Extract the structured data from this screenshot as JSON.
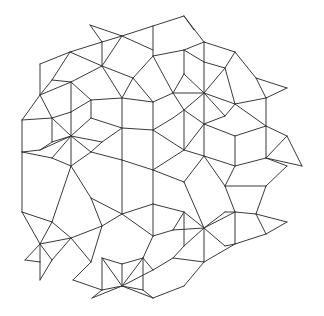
{
  "figure": {
    "stroke_color": "#3a3a3a",
    "background": "#ffffff",
    "width": 324,
    "height": 316,
    "segments": [
      [
        90,
        25,
        102,
        42
      ],
      [
        90,
        25,
        122,
        36
      ],
      [
        102,
        42,
        122,
        36
      ],
      [
        102,
        42,
        70,
        52
      ],
      [
        122,
        36,
        153,
        26
      ],
      [
        153,
        26,
        184,
        16
      ],
      [
        184,
        16,
        204,
        42
      ],
      [
        184,
        16,
        194,
        30
      ],
      [
        122,
        36,
        153,
        50
      ],
      [
        153,
        26,
        153,
        56
      ],
      [
        122,
        36,
        102,
        66
      ],
      [
        102,
        42,
        102,
        66
      ],
      [
        70,
        52,
        102,
        66
      ],
      [
        70,
        52,
        52,
        80
      ],
      [
        70,
        52,
        40,
        64
      ],
      [
        40,
        64,
        40,
        95
      ],
      [
        40,
        95,
        52,
        80
      ],
      [
        52,
        80,
        71,
        82
      ],
      [
        71,
        82,
        102,
        66
      ],
      [
        71,
        82,
        40,
        95
      ],
      [
        102,
        66,
        133,
        78
      ],
      [
        153,
        56,
        133,
        78
      ],
      [
        153,
        56,
        184,
        50
      ],
      [
        184,
        50,
        204,
        42
      ],
      [
        204,
        42,
        235,
        52
      ],
      [
        204,
        42,
        204,
        62
      ],
      [
        184,
        50,
        204,
        62
      ],
      [
        204,
        62,
        225,
        68
      ],
      [
        235,
        52,
        225,
        68
      ],
      [
        235,
        52,
        256,
        78
      ],
      [
        256,
        78,
        287,
        88
      ],
      [
        256,
        78,
        266,
        98
      ],
      [
        287,
        88,
        266,
        98
      ],
      [
        266,
        98,
        266,
        126
      ],
      [
        266,
        98,
        235,
        104
      ],
      [
        225,
        68,
        235,
        104
      ],
      [
        204,
        93,
        225,
        68
      ],
      [
        204,
        93,
        204,
        62
      ],
      [
        204,
        93,
        184,
        74
      ],
      [
        184,
        74,
        184,
        50
      ],
      [
        204,
        93,
        184,
        110
      ],
      [
        204,
        93,
        225,
        116
      ],
      [
        204,
        93,
        235,
        104
      ],
      [
        204,
        93,
        173,
        93
      ],
      [
        173,
        93,
        184,
        74
      ],
      [
        173,
        93,
        153,
        56
      ],
      [
        173,
        93,
        184,
        110
      ],
      [
        184,
        110,
        204,
        124
      ],
      [
        225,
        116,
        204,
        124
      ],
      [
        225,
        116,
        235,
        104
      ],
      [
        204,
        93,
        204,
        124
      ],
      [
        133,
        78,
        153,
        102
      ],
      [
        153,
        102,
        173,
        93
      ],
      [
        153,
        102,
        153,
        130
      ],
      [
        133,
        78,
        122,
        98
      ],
      [
        122,
        98,
        102,
        66
      ],
      [
        122,
        98,
        122,
        128
      ],
      [
        122,
        98,
        153,
        102
      ],
      [
        71,
        82,
        71,
        112
      ],
      [
        71,
        82,
        91,
        100
      ],
      [
        91,
        100,
        122,
        98
      ],
      [
        91,
        100,
        71,
        112
      ],
      [
        71,
        112,
        52,
        118
      ],
      [
        52,
        118,
        40,
        95
      ],
      [
        52,
        118,
        22,
        120
      ],
      [
        22,
        120,
        40,
        95
      ],
      [
        22,
        120,
        22,
        152
      ],
      [
        22,
        152,
        52,
        158
      ],
      [
        52,
        118,
        52,
        142
      ],
      [
        71,
        136,
        52,
        118
      ],
      [
        71,
        136,
        71,
        112
      ],
      [
        71,
        136,
        91,
        118
      ],
      [
        91,
        118,
        91,
        100
      ],
      [
        91,
        118,
        122,
        128
      ],
      [
        71,
        136,
        102,
        142
      ],
      [
        102,
        142,
        122,
        128
      ],
      [
        71,
        136,
        91,
        152
      ],
      [
        91,
        152,
        102,
        142
      ],
      [
        71,
        136,
        52,
        142
      ],
      [
        52,
        142,
        40,
        150
      ],
      [
        40,
        150,
        22,
        152
      ],
      [
        71,
        136,
        40,
        150
      ],
      [
        71,
        136,
        71,
        166
      ],
      [
        71,
        136,
        52,
        158
      ],
      [
        52,
        158,
        71,
        166
      ],
      [
        91,
        152,
        71,
        166
      ],
      [
        91,
        152,
        122,
        160
      ],
      [
        122,
        128,
        153,
        130
      ],
      [
        153,
        130,
        173,
        118
      ],
      [
        173,
        118,
        184,
        110
      ],
      [
        153,
        130,
        184,
        150
      ],
      [
        184,
        110,
        184,
        150
      ],
      [
        184,
        150,
        204,
        124
      ],
      [
        122,
        128,
        122,
        160
      ],
      [
        122,
        160,
        153,
        170
      ],
      [
        153,
        130,
        153,
        170
      ],
      [
        153,
        170,
        184,
        150
      ],
      [
        204,
        124,
        235,
        136
      ],
      [
        235,
        104,
        266,
        126
      ],
      [
        266,
        126,
        235,
        136
      ],
      [
        266,
        126,
        287,
        136
      ],
      [
        287,
        136,
        266,
        158
      ],
      [
        266,
        126,
        266,
        158
      ],
      [
        266,
        158,
        287,
        166
      ],
      [
        287,
        136,
        302,
        166
      ],
      [
        302,
        166,
        266,
        158
      ],
      [
        287,
        166,
        266,
        186
      ],
      [
        235,
        136,
        235,
        166
      ],
      [
        235,
        166,
        266,
        158
      ],
      [
        204,
        124,
        204,
        156
      ],
      [
        204,
        156,
        235,
        166
      ],
      [
        204,
        156,
        184,
        150
      ],
      [
        204,
        156,
        184,
        182
      ],
      [
        184,
        182,
        153,
        170
      ],
      [
        235,
        166,
        225,
        186
      ],
      [
        225,
        186,
        204,
        156
      ],
      [
        225,
        186,
        266,
        186
      ],
      [
        266,
        186,
        256,
        214
      ],
      [
        225,
        186,
        235,
        212
      ],
      [
        235,
        212,
        256,
        214
      ],
      [
        256,
        214,
        287,
        222
      ],
      [
        287,
        222,
        266,
        234
      ],
      [
        266,
        234,
        256,
        214
      ],
      [
        266,
        234,
        235,
        244
      ],
      [
        235,
        212,
        235,
        244
      ],
      [
        235,
        212,
        204,
        228
      ],
      [
        204,
        228,
        184,
        182
      ],
      [
        204,
        228,
        184,
        212
      ],
      [
        184,
        212,
        153,
        204
      ],
      [
        153,
        204,
        153,
        170
      ],
      [
        204,
        228,
        225,
        246
      ],
      [
        225,
        246,
        235,
        244
      ],
      [
        204,
        228,
        204,
        262
      ],
      [
        204,
        228,
        184,
        246
      ],
      [
        184,
        246,
        184,
        212
      ],
      [
        204,
        228,
        225,
        212
      ],
      [
        225,
        212,
        235,
        212
      ],
      [
        204,
        228,
        173,
        230
      ],
      [
        173,
        230,
        184,
        212
      ],
      [
        184,
        246,
        173,
        258
      ],
      [
        173,
        258,
        204,
        262
      ],
      [
        204,
        262,
        235,
        244
      ],
      [
        204,
        262,
        184,
        286
      ],
      [
        184,
        286,
        153,
        298
      ],
      [
        173,
        258,
        153,
        270
      ],
      [
        153,
        270,
        122,
        286
      ],
      [
        153,
        204,
        122,
        214
      ],
      [
        122,
        214,
        122,
        160
      ],
      [
        122,
        214,
        91,
        198
      ],
      [
        91,
        198,
        71,
        166
      ],
      [
        91,
        198,
        102,
        226
      ],
      [
        102,
        226,
        122,
        214
      ],
      [
        102,
        226,
        71,
        238
      ],
      [
        71,
        238,
        52,
        222
      ],
      [
        52,
        222,
        71,
        166
      ],
      [
        52,
        222,
        22,
        212
      ],
      [
        22,
        212,
        22,
        152
      ],
      [
        22,
        212,
        40,
        244
      ],
      [
        40,
        244,
        52,
        222
      ],
      [
        40,
        244,
        25,
        260
      ],
      [
        25,
        260,
        40,
        262
      ],
      [
        40,
        244,
        40,
        262
      ],
      [
        40,
        244,
        71,
        238
      ],
      [
        40,
        244,
        52,
        260
      ],
      [
        52,
        260,
        71,
        238
      ],
      [
        40,
        262,
        40,
        280
      ],
      [
        40,
        280,
        52,
        260
      ],
      [
        71,
        238,
        91,
        262
      ],
      [
        91,
        262,
        102,
        226
      ],
      [
        91,
        262,
        73,
        280
      ],
      [
        73,
        280,
        102,
        290
      ],
      [
        102,
        290,
        122,
        286
      ],
      [
        122,
        286,
        102,
        258
      ],
      [
        102,
        258,
        102,
        290
      ],
      [
        122,
        286,
        143,
        258
      ],
      [
        143,
        258,
        143,
        290
      ],
      [
        143,
        290,
        122,
        286
      ],
      [
        102,
        258,
        122,
        264
      ],
      [
        122,
        264,
        143,
        258
      ],
      [
        122,
        264,
        122,
        286
      ],
      [
        143,
        258,
        153,
        270
      ],
      [
        143,
        258,
        153,
        236
      ],
      [
        153,
        236,
        122,
        214
      ],
      [
        153,
        236,
        173,
        230
      ],
      [
        153,
        236,
        153,
        204
      ],
      [
        122,
        286,
        92,
        298
      ],
      [
        92,
        298,
        102,
        290
      ],
      [
        122,
        286,
        153,
        298
      ],
      [
        153,
        298,
        143,
        290
      ]
    ]
  }
}
